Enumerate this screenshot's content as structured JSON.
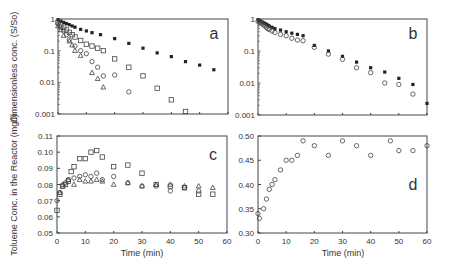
{
  "figure": {
    "xlabel": "Time (min)",
    "ylabel_top": "Dimensionless conc. (S/So)",
    "ylabel_bottom": "Toluene Conc. in the Reactor (mg/l)"
  },
  "chart_data": [
    {
      "panel": "a",
      "type": "scatter",
      "yscale": "log",
      "ylim": [
        0.001,
        1
      ],
      "xlim": [
        0,
        60
      ],
      "yticks": [
        "1",
        "0.1",
        "0.01",
        "0.001"
      ],
      "xticks_labeled": false,
      "ylabel": "Dimensionless conc. (S/So)",
      "series": [
        {
          "name": "filled squares",
          "marker": "filled-square",
          "x": [
            0,
            1,
            2,
            3,
            4,
            5,
            6,
            8,
            10,
            12,
            15,
            20,
            25,
            30,
            35,
            40,
            45,
            50,
            55
          ],
          "y": [
            0.95,
            0.85,
            0.78,
            0.72,
            0.66,
            0.6,
            0.55,
            0.47,
            0.42,
            0.37,
            0.32,
            0.24,
            0.17,
            0.12,
            0.085,
            0.065,
            0.045,
            0.035,
            0.025
          ]
        },
        {
          "name": "open squares",
          "marker": "open-square",
          "x": [
            0,
            1,
            2,
            3,
            4,
            5,
            6,
            8,
            10,
            12,
            14,
            16,
            20,
            25,
            30,
            35,
            40,
            45
          ],
          "y": [
            0.8,
            0.65,
            0.55,
            0.45,
            0.38,
            0.32,
            0.27,
            0.21,
            0.16,
            0.14,
            0.12,
            0.1,
            0.055,
            0.03,
            0.016,
            0.0065,
            0.0028,
            0.0012
          ]
        },
        {
          "name": "open circles",
          "marker": "open-circle",
          "x": [
            0,
            1,
            2,
            3,
            4,
            6,
            8,
            10,
            12,
            14,
            16,
            20,
            25
          ],
          "y": [
            0.7,
            0.55,
            0.42,
            0.32,
            0.22,
            0.14,
            0.1,
            0.08,
            0.045,
            0.03,
            0.016,
            0.017,
            0.005
          ]
        },
        {
          "name": "open triangles",
          "marker": "open-triangle",
          "x": [
            0,
            1,
            2,
            4,
            5,
            6,
            8,
            12,
            14,
            16
          ],
          "y": [
            0.6,
            0.45,
            0.3,
            0.2,
            0.15,
            0.1,
            0.07,
            0.02,
            0.013,
            0.007
          ]
        }
      ],
      "annotation": "a"
    },
    {
      "panel": "b",
      "type": "scatter",
      "yscale": "log",
      "ylim": [
        0.001,
        1
      ],
      "xlim": [
        0,
        60
      ],
      "yticks": [
        "1",
        "0.1",
        "0.01",
        "0.001"
      ],
      "xticks_labeled": false,
      "series": [
        {
          "name": "filled squares",
          "marker": "filled-square",
          "x": [
            0,
            0.5,
            1,
            1.5,
            2,
            2.5,
            3,
            3.5,
            4,
            5,
            6,
            8,
            10,
            12,
            14,
            16,
            20,
            25,
            30,
            35,
            40,
            45,
            50,
            55,
            60
          ],
          "y": [
            0.95,
            0.9,
            0.85,
            0.8,
            0.76,
            0.72,
            0.68,
            0.64,
            0.6,
            0.55,
            0.5,
            0.45,
            0.4,
            0.36,
            0.33,
            0.3,
            0.15,
            0.1,
            0.068,
            0.045,
            0.03,
            0.022,
            0.014,
            0.009,
            0.0023
          ]
        },
        {
          "name": "open circles",
          "marker": "open-circle",
          "x": [
            0,
            0.5,
            1,
            1.5,
            2,
            2.5,
            3,
            3.5,
            4,
            5,
            6,
            8,
            10,
            12,
            14,
            16,
            20,
            25,
            30,
            35,
            40,
            45,
            50,
            55
          ],
          "y": [
            0.85,
            0.8,
            0.75,
            0.7,
            0.65,
            0.6,
            0.55,
            0.5,
            0.47,
            0.42,
            0.38,
            0.33,
            0.3,
            0.25,
            0.22,
            0.21,
            0.13,
            0.08,
            0.055,
            0.03,
            0.021,
            0.01,
            0.009,
            0.0045
          ]
        }
      ],
      "annotation": "b"
    },
    {
      "panel": "c",
      "type": "scatter",
      "ylim": [
        0.05,
        0.11
      ],
      "xlim": [
        0,
        60
      ],
      "yticks": [
        "0.05",
        "0.06",
        "0.07",
        "0.08",
        "0.09",
        "0.10",
        "0.11"
      ],
      "xticks": [
        "0",
        "10",
        "20",
        "30",
        "40",
        "50",
        "60"
      ],
      "xlabel": "Time (min)",
      "ylabel": "Toluene Conc. in the Reactor (mg/l)",
      "series": [
        {
          "name": "open squares",
          "marker": "open-square",
          "x": [
            0,
            1,
            2,
            3,
            4,
            5,
            6,
            8,
            10,
            12,
            14,
            16,
            20,
            25,
            30,
            35,
            40,
            45,
            50,
            55
          ],
          "y": [
            0.064,
            0.074,
            0.079,
            0.08,
            0.082,
            0.088,
            0.091,
            0.096,
            0.096,
            0.1,
            0.101,
            0.097,
            0.091,
            0.092,
            0.087,
            0.08,
            0.079,
            0.078,
            0.074,
            0.074
          ]
        },
        {
          "name": "open circles",
          "marker": "open-circle",
          "x": [
            0,
            1,
            2,
            3,
            4,
            6,
            8,
            10,
            12,
            14,
            16,
            20,
            25,
            30,
            35,
            40,
            45,
            50
          ],
          "y": [
            0.07,
            0.075,
            0.079,
            0.081,
            0.083,
            0.084,
            0.085,
            0.086,
            0.085,
            0.087,
            0.083,
            0.085,
            0.081,
            0.079,
            0.079,
            0.076,
            0.078,
            0.076
          ]
        },
        {
          "name": "open triangles",
          "marker": "open-triangle",
          "x": [
            1,
            2,
            4,
            6,
            8,
            10,
            12,
            14,
            16,
            20,
            25,
            30,
            35,
            40,
            45,
            50,
            55
          ],
          "y": [
            0.075,
            0.08,
            0.083,
            0.08,
            0.083,
            0.082,
            0.082,
            0.083,
            0.082,
            0.08,
            0.081,
            0.079,
            0.08,
            0.08,
            0.079,
            0.079,
            0.078
          ]
        }
      ],
      "annotation": "c"
    },
    {
      "panel": "d",
      "type": "scatter",
      "ylim": [
        0.3,
        0.5
      ],
      "xlim": [
        0,
        60
      ],
      "yticks": [
        "0.30",
        "0.35",
        "0.40",
        "0.45",
        "0.50"
      ],
      "xticks": [
        "0",
        "10",
        "20",
        "30",
        "40",
        "50",
        "60"
      ],
      "xlabel": "Time (min)",
      "series": [
        {
          "name": "open diamonds",
          "marker": "open-circle",
          "x": [
            0,
            0.5,
            2,
            3,
            4,
            5,
            6,
            8,
            10,
            12,
            14,
            16,
            20,
            25,
            30,
            35,
            40,
            47,
            50,
            55,
            60
          ],
          "y": [
            0.34,
            0.33,
            0.35,
            0.37,
            0.39,
            0.4,
            0.41,
            0.43,
            0.45,
            0.45,
            0.46,
            0.49,
            0.48,
            0.46,
            0.49,
            0.48,
            0.46,
            0.49,
            0.47,
            0.47,
            0.48
          ]
        }
      ],
      "annotation": "d"
    }
  ]
}
